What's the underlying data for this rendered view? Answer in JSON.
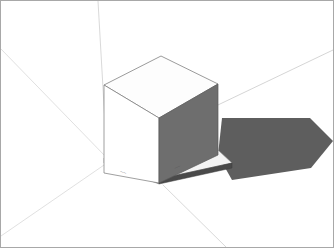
{
  "viewport": {
    "width": 334,
    "height": 248,
    "background_color": "#ffffff"
  },
  "frame": {
    "name": "render-border",
    "border_color": "#a8a8a8",
    "border_width": 1
  },
  "scene": {
    "title": "3d-cube-perspective-render",
    "description": "White cube on thin base plinth with cast shadow over a perspective ground grid",
    "ground_color": "#ffffff",
    "grid_line_color": "#c9c9c9",
    "construction_line_color": "#d6d6d6"
  },
  "cube": {
    "name": "cube-solid",
    "top_face_color": "#fdfdfd",
    "left_face_color": "#ffffff",
    "right_face_color": "#6e6e6e",
    "edge_color": "#6a6a6a",
    "edge_width": 0.7,
    "vertices": {
      "top_back": [
        161,
        56
      ],
      "top_left": [
        104,
        85
      ],
      "top_right": [
        218,
        84
      ],
      "top_front": [
        159,
        118
      ],
      "bottom_left": [
        104,
        173
      ],
      "bottom_front": [
        159,
        183
      ],
      "bottom_right": [
        218,
        155
      ]
    }
  },
  "plinth": {
    "name": "base-plinth",
    "top_color": "#f2f2f2",
    "side_color": "#555555",
    "edge_color": "#777777",
    "thickness": 5
  },
  "shadow": {
    "name": "cast-shadow",
    "fill_color": "#5e5e5e",
    "direction": "right",
    "points": "218,155 222,118 310,118 333,141 311,168 232,180"
  },
  "grid_lines": [
    {
      "name": "grid-vertical-upper",
      "x1": 98,
      "y1": 1,
      "x2": 107,
      "y2": 158
    },
    {
      "name": "grid-horizon-right",
      "x1": 107,
      "y1": 158,
      "x2": 333,
      "y2": 50
    },
    {
      "name": "grid-diagonal-left-upper",
      "x1": 1,
      "y1": 49,
      "x2": 107,
      "y2": 158
    },
    {
      "name": "grid-diagonal-left-lower",
      "x1": 1,
      "y1": 236,
      "x2": 107,
      "y2": 163
    },
    {
      "name": "grid-diagonal-foreground",
      "x1": 163,
      "y1": 185,
      "x2": 226,
      "y2": 247
    },
    {
      "name": "grid-baseline-left",
      "x1": 107,
      "y1": 163,
      "x2": 163,
      "y2": 185
    }
  ],
  "annotations": [
    {
      "name": "dimension-label-front-left",
      "x": 122,
      "y": 174,
      "text": "——",
      "rotation": 20
    },
    {
      "name": "dimension-label-front-right",
      "x": 176,
      "y": 170,
      "text": "——",
      "rotation": -24
    }
  ]
}
